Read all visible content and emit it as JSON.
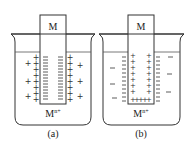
{
  "diagram": {
    "panels": [
      {
        "id": "a",
        "electrode_label": "M",
        "ion_label_base": "M",
        "ion_label_sup": "n+",
        "caption": "(a)",
        "electrode_surface_charge": "negative",
        "solution_charge": "positive",
        "electrode_symbol": "−",
        "solution_symbol": "+"
      },
      {
        "id": "b",
        "electrode_label": "M",
        "ion_label_base": "M",
        "ion_label_sup": "n+",
        "caption": "(b)",
        "electrode_surface_charge": "positive",
        "solution_charge": "negative",
        "electrode_symbol": "+",
        "solution_symbol": "−"
      }
    ],
    "colors": {
      "line": "#333333",
      "liquid_line": "#555555",
      "background": "#ffffff"
    }
  }
}
